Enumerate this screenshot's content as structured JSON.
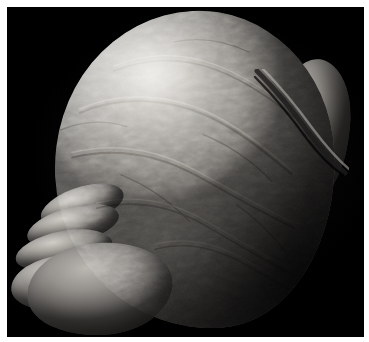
{
  "image": {
    "kind": "photograph",
    "medium": "black-and-white photograph",
    "subject_label": "anatomical specimen",
    "description": "Grayscale photograph of a large rounded gyrencephalic anatomical specimen with a deeply convoluted surface, lit from the upper left, photographed against a plain black background.",
    "caption": "",
    "orientation": "landscape",
    "width_px": 369,
    "height_px": 342
  },
  "frame": {
    "name": "white photographic border",
    "color": "#ffffff",
    "top_px": 7,
    "left_px": 7,
    "right_px": 8,
    "bottom_px": 6
  },
  "plate": {
    "name": "photo plate",
    "background_color": "#000000",
    "left_px": 7,
    "top_px": 7,
    "width_px": 357,
    "height_px": 330
  },
  "specimen": {
    "name": "specimen mass",
    "shape": "rounded ovoid, broader at upper right, tapering to digitate lobes at lower left",
    "surface": "finely convoluted and wrinkled, gyral ridges and sulci",
    "highlight_color": "#dedbd5",
    "midtone_color": "#9a978f",
    "shadow_color": "#4a4845",
    "deep_shadow_color": "#23221f",
    "lighting": "directional from upper left",
    "bounds": {
      "top_px": 14,
      "bottom_px": 326,
      "left_px": 34,
      "right_px": 332
    },
    "features": [
      {
        "name": "dome",
        "label": "superior dome",
        "note": "Brightest region; broad smooth-curving cap with granular stippled texture."
      },
      {
        "name": "fissure",
        "label": "oblique fissure",
        "note": "Deep dark cleft running diagonally down the upper right, separating the posterior bulge."
      },
      {
        "name": "posterior-lobe",
        "label": "posterior bulge",
        "note": "Rounded lobe to the right of the fissure, falling into shadow at the rim."
      },
      {
        "name": "digits",
        "label": "digitate lobes",
        "note": "Four finger- or toe-like rounded projections on the lower left."
      },
      {
        "name": "sole-mass",
        "label": "inferior mass",
        "note": "Broad rounded mass beneath the digitate lobes, in partial shadow."
      }
    ],
    "digit_count": 4
  },
  "palette": {
    "border": "#ffffff",
    "background": "#000000",
    "highlight": "#dedbd5",
    "light": "#c6c3bc",
    "midtone": "#9a978f",
    "shadow": "#6d6a66",
    "deep_shadow": "#3a3836"
  }
}
